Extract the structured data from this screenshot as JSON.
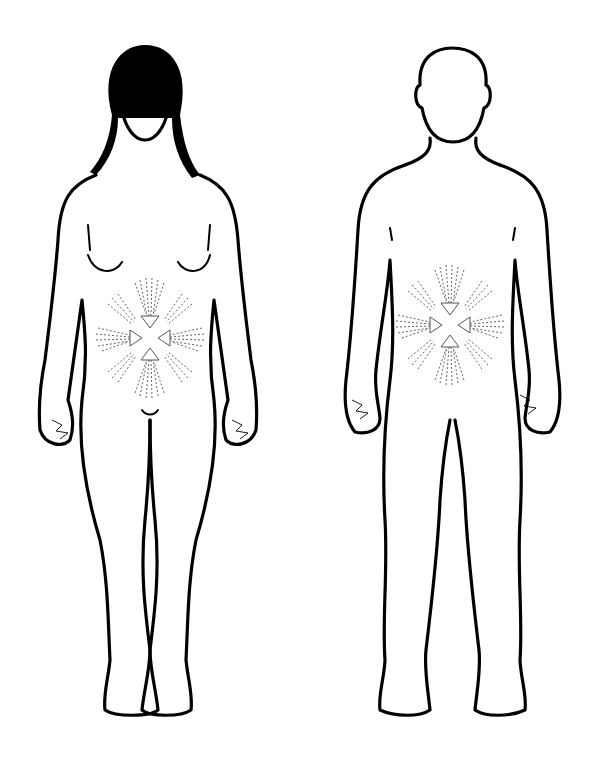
{
  "figure": {
    "type": "body-diagram",
    "figures": [
      {
        "name": "female-figure",
        "view": "front"
      },
      {
        "name": "male-figure",
        "view": "front"
      }
    ],
    "annotations": [
      {
        "name": "abdominal-pain-radiating-arrows",
        "figure": "female-figure",
        "direction": "inward",
        "arrow_count": 8
      },
      {
        "name": "abdominal-pain-radiating-arrows",
        "figure": "male-figure",
        "direction": "inward",
        "arrow_count": 8
      },
      {
        "name": "hand-scribble",
        "figure": "female-figure",
        "side": "both"
      },
      {
        "name": "hand-scribble",
        "figure": "male-figure",
        "side": "both"
      }
    ],
    "colors": {
      "line": "#000000",
      "background": "#ffffff",
      "annotation": "#555555"
    }
  }
}
